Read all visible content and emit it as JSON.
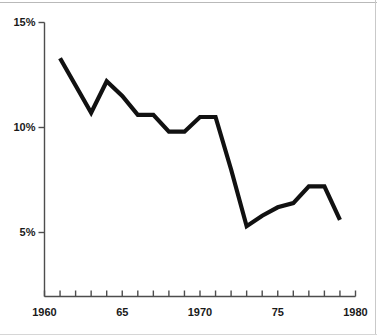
{
  "chart_data": {
    "type": "line",
    "title": "",
    "subtitle": "",
    "xlabel": "",
    "ylabel": "",
    "xlim": [
      1960,
      1980
    ],
    "ylim": [
      0,
      15
    ],
    "grid": false,
    "legend": null,
    "line_color": "#111111",
    "axis_color": "#4d4d4d",
    "y_ticks": [
      {
        "value": 15,
        "label": "15%"
      },
      {
        "value": 10,
        "label": "10%"
      },
      {
        "value": 5,
        "label": "5%"
      }
    ],
    "y_minor_ticks": [],
    "x_ticks": [
      {
        "value": 1960,
        "label": "1960"
      },
      {
        "value": 1961,
        "label": ""
      },
      {
        "value": 1962,
        "label": ""
      },
      {
        "value": 1963,
        "label": ""
      },
      {
        "value": 1964,
        "label": ""
      },
      {
        "value": 1965,
        "label": "65"
      },
      {
        "value": 1966,
        "label": ""
      },
      {
        "value": 1967,
        "label": ""
      },
      {
        "value": 1968,
        "label": ""
      },
      {
        "value": 1969,
        "label": ""
      },
      {
        "value": 1970,
        "label": "1970"
      },
      {
        "value": 1971,
        "label": ""
      },
      {
        "value": 1972,
        "label": ""
      },
      {
        "value": 1973,
        "label": ""
      },
      {
        "value": 1974,
        "label": ""
      },
      {
        "value": 1975,
        "label": "75"
      },
      {
        "value": 1976,
        "label": ""
      },
      {
        "value": 1977,
        "label": ""
      },
      {
        "value": 1978,
        "label": ""
      },
      {
        "value": 1979,
        "label": ""
      },
      {
        "value": 1980,
        "label": "1980"
      }
    ],
    "x": [
      1961,
      1962,
      1963,
      1964,
      1965,
      1966,
      1967,
      1968,
      1969,
      1970,
      1971,
      1972,
      1973,
      1974,
      1975,
      1976,
      1977,
      1978,
      1979
    ],
    "values": [
      13.3,
      12.0,
      10.7,
      12.2,
      11.5,
      10.6,
      10.6,
      9.8,
      9.8,
      10.5,
      10.5,
      8.0,
      5.3,
      5.8,
      6.2,
      6.4,
      7.2,
      7.2,
      5.6
    ],
    "series": [
      {
        "name": "",
        "values": [
          13.3,
          12.0,
          10.7,
          12.2,
          11.5,
          10.6,
          10.6,
          9.8,
          9.8,
          10.5,
          10.5,
          8.0,
          5.3,
          5.8,
          6.2,
          6.4,
          7.2,
          7.2,
          5.6
        ]
      }
    ]
  }
}
